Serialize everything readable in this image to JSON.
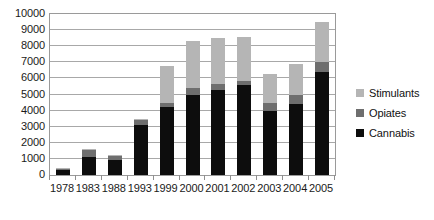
{
  "chart_data": {
    "type": "bar",
    "stacked": true,
    "title": "",
    "subtitle": "",
    "xlabel": "",
    "ylabel": "",
    "categories": [
      "1978",
      "1983",
      "1988",
      "1993",
      "1999",
      "2000",
      "2001",
      "2002",
      "2003",
      "2004",
      "2005"
    ],
    "series": [
      {
        "name": "Cannabis",
        "color": "#0d0d0d",
        "values": [
          330,
          1100,
          950,
          3100,
          4200,
          4950,
          5250,
          5600,
          3950,
          4400,
          6400
        ]
      },
      {
        "name": "Opiates",
        "color": "#6e6e6e",
        "values": [
          60,
          480,
          290,
          340,
          300,
          450,
          400,
          250,
          550,
          550,
          600
        ]
      },
      {
        "name": "Stimulants",
        "color": "#b5b5b5",
        "values": [
          20,
          60,
          30,
          30,
          2300,
          2950,
          2850,
          2700,
          1800,
          1950,
          2500
        ]
      }
    ],
    "totals": [
      410,
      1640,
      1270,
      3470,
      6800,
      8350,
      8500,
      8550,
      6300,
      6900,
      9500
    ],
    "ylim": [
      0,
      10000
    ],
    "y_ticks": [
      0,
      1000,
      2000,
      3000,
      4000,
      5000,
      6000,
      7000,
      8000,
      9000,
      10000
    ],
    "y_tick_labels": [
      "0",
      "1000",
      "2000",
      "3000",
      "4000",
      "5000",
      "6000",
      "7000",
      "8000",
      "9000",
      "10000"
    ],
    "grid": true,
    "legend_position": "right",
    "legend": [
      {
        "label": "Stimulants",
        "color": "#b5b5b5"
      },
      {
        "label": "Opiates",
        "color": "#6e6e6e"
      },
      {
        "label": "Cannabis",
        "color": "#0d0d0d"
      }
    ],
    "plot_border_color": "#9a9a9a",
    "gridline_color": "#a8a8a8",
    "background_color": "#ffffff"
  }
}
